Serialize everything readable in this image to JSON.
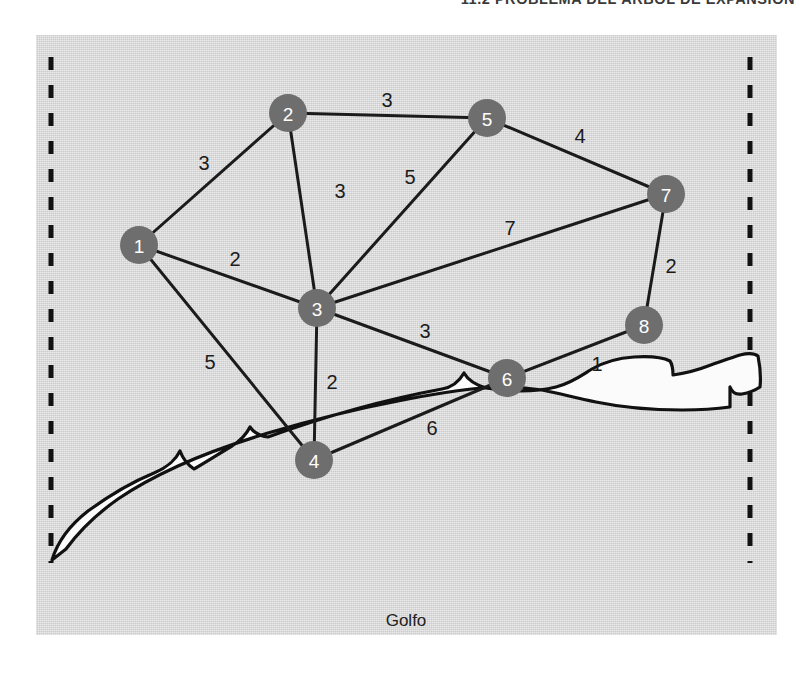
{
  "running_head": "11.2   PROBLEMA DEL ÁRBOL DE EXPANSIÓN",
  "figure": {
    "gulf_label": "Golfo",
    "colors": {
      "panel_background": "#d4d4d4",
      "node_fill": "#6e6e6e",
      "node_text": "#ffffff",
      "edge_stroke": "#1b1b1b",
      "boundary_stroke": "#111111",
      "coast_fill": "#fbfbfb"
    },
    "boundaries": [
      {
        "name": "west-boundary",
        "x": 15,
        "y1": 22,
        "y2": 528
      },
      {
        "name": "east-boundary",
        "x": 714,
        "y1": 22,
        "y2": 528
      }
    ],
    "nodes": [
      {
        "id": "1",
        "label": "1",
        "x": 103,
        "y": 210,
        "r": 19
      },
      {
        "id": "2",
        "label": "2",
        "x": 252,
        "y": 78,
        "r": 19
      },
      {
        "id": "3",
        "label": "3",
        "x": 281,
        "y": 273,
        "r": 19
      },
      {
        "id": "4",
        "label": "4",
        "x": 278,
        "y": 425,
        "r": 19
      },
      {
        "id": "5",
        "label": "5",
        "x": 451,
        "y": 83,
        "r": 19
      },
      {
        "id": "6",
        "label": "6",
        "x": 471,
        "y": 343,
        "r": 19
      },
      {
        "id": "7",
        "label": "7",
        "x": 630,
        "y": 159,
        "r": 19
      },
      {
        "id": "8",
        "label": "8",
        "x": 608,
        "y": 290,
        "r": 19
      }
    ],
    "edges": [
      {
        "from": "1",
        "to": "2",
        "weight": "3",
        "label_x": 168,
        "label_y": 128
      },
      {
        "from": "1",
        "to": "3",
        "weight": "2",
        "label_x": 199,
        "label_y": 224
      },
      {
        "from": "1",
        "to": "4",
        "weight": "5",
        "label_x": 174,
        "label_y": 327
      },
      {
        "from": "2",
        "to": "3",
        "weight": "3",
        "label_x": 304,
        "label_y": 156
      },
      {
        "from": "2",
        "to": "5",
        "weight": "3",
        "label_x": 351,
        "label_y": 65
      },
      {
        "from": "3",
        "to": "5",
        "weight": "5",
        "label_x": 374,
        "label_y": 142
      },
      {
        "from": "3",
        "to": "4",
        "weight": "2",
        "label_x": 296,
        "label_y": 347
      },
      {
        "from": "3",
        "to": "6",
        "weight": "3",
        "label_x": 389,
        "label_y": 296
      },
      {
        "from": "3",
        "to": "7",
        "weight": "7",
        "label_x": 474,
        "label_y": 193
      },
      {
        "from": "5",
        "to": "7",
        "weight": "4",
        "label_x": 544,
        "label_y": 101
      },
      {
        "from": "7",
        "to": "8",
        "weight": "2",
        "label_x": 635,
        "label_y": 231
      },
      {
        "from": "6",
        "to": "8",
        "weight": "1",
        "label_x": 561,
        "label_y": 329
      },
      {
        "from": "4",
        "to": "6",
        "weight": "6",
        "label_x": 396,
        "label_y": 393
      }
    ],
    "gulf_label_pos": {
      "x": 370,
      "y": 585
    }
  }
}
